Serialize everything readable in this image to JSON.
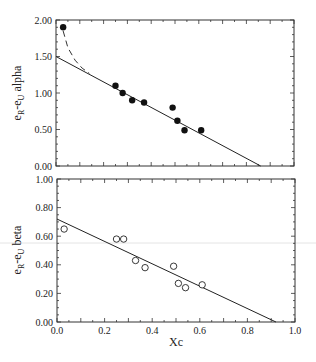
{
  "chart_data": [
    {
      "type": "scatter",
      "title": "",
      "ylabel": "eR-eU alpha",
      "xlabel": "",
      "xlim": [
        0.0,
        1.0
      ],
      "ylim": [
        0.0,
        2.0
      ],
      "yticks": [
        "0.00",
        "0.50",
        "1.00",
        "1.50",
        "2.00"
      ],
      "marker": "filled-circle",
      "x": [
        0.03,
        0.25,
        0.28,
        0.32,
        0.37,
        0.49,
        0.51,
        0.54,
        0.61
      ],
      "y": [
        1.9,
        1.1,
        1.0,
        0.9,
        0.87,
        0.8,
        0.62,
        0.49,
        0.49
      ],
      "fit_line": {
        "x": [
          0.0,
          0.86
        ],
        "y": [
          1.5,
          0.0
        ],
        "style": "solid"
      },
      "dashed_curve": {
        "x": [
          0.03,
          0.05,
          0.08,
          0.11,
          0.14
        ],
        "y": [
          1.85,
          1.62,
          1.45,
          1.34,
          1.27
        ],
        "style": "dashed"
      }
    },
    {
      "type": "scatter",
      "title": "",
      "ylabel": "eR-eU beta",
      "xlabel": "Xc",
      "xlim": [
        0.0,
        1.0
      ],
      "ylim": [
        0.0,
        1.0
      ],
      "xticks": [
        "0.0",
        "0.2",
        "0.4",
        "0.6",
        "0.8",
        "1.0"
      ],
      "yticks": [
        "0.00",
        "0.20",
        "0.40",
        "0.60",
        "0.80",
        "1.00"
      ],
      "marker": "open-circle",
      "x": [
        0.03,
        0.25,
        0.28,
        0.33,
        0.37,
        0.49,
        0.51,
        0.54,
        0.61
      ],
      "y": [
        0.65,
        0.58,
        0.58,
        0.43,
        0.38,
        0.39,
        0.27,
        0.24,
        0.26
      ],
      "fit_line": {
        "x": [
          0.0,
          0.92
        ],
        "y": [
          0.72,
          0.0
        ],
        "style": "solid"
      }
    }
  ],
  "labels": {
    "top_ylabel_main": "e",
    "top_ylabel_sub1": "R",
    "top_ylabel_mid": "-e",
    "top_ylabel_sub2": "U",
    "top_ylabel_suffix": " alpha",
    "bottom_ylabel_suffix": " beta",
    "xlabel": "Xc"
  }
}
